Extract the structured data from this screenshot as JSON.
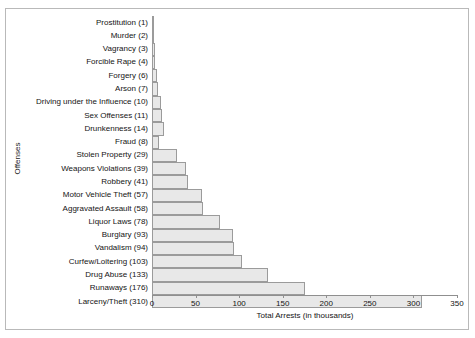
{
  "chart_data": {
    "type": "bar",
    "orientation": "horizontal",
    "title": "",
    "xlabel": "Total Arrests (in thousands)",
    "ylabel": "Offenses",
    "xlim": [
      0,
      350
    ],
    "xticks": [
      0,
      50,
      100,
      150,
      200,
      250,
      300,
      350
    ],
    "grid": false,
    "legend": false,
    "bar_fill_color": "#e8e8e8",
    "bar_border_color": "#9b9b9b",
    "categories": [
      "Prostitution (1)",
      "Murder (2)",
      "Vagrancy (3)",
      "Forcible Rape (4)",
      "Forgery (6)",
      "Arson (7)",
      "Driving under the Influence (10)",
      "Sex Offenses (11)",
      "Drunkenness (14)",
      "Fraud (8)",
      "Stolen Property (29)",
      "Weapons Violations (39)",
      "Robbery (41)",
      "Motor Vehicle Theft (57)",
      "Aggravated Assault (58)",
      "Liquor Laws (78)",
      "Burglary (93)",
      "Vandalism (94)",
      "Curfew/Loitering (103)",
      "Drug Abuse (133)",
      "Runaways (176)",
      "Larceny/Theft (310)"
    ],
    "values": [
      1,
      2,
      3,
      4,
      6,
      7,
      10,
      11,
      14,
      8,
      29,
      39,
      41,
      57,
      58,
      78,
      93,
      94,
      103,
      133,
      176,
      310
    ]
  }
}
